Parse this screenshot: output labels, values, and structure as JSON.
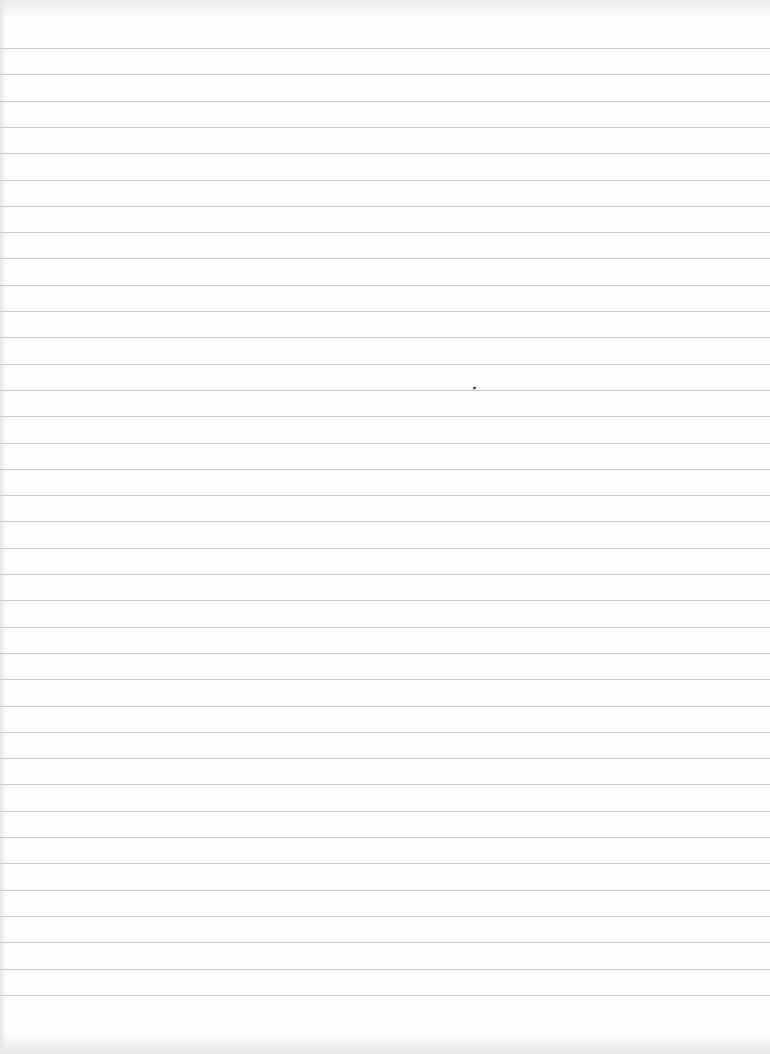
{
  "sheet": {
    "type": "lined-paper",
    "background_color": "#fdfdfd",
    "rule_color": "#c9c9c9",
    "rule_count": 37,
    "first_rule_y": 48,
    "rule_spacing": 26.3,
    "marks": [
      {
        "name": "pen-dot",
        "x": 473,
        "y": 387
      }
    ]
  }
}
